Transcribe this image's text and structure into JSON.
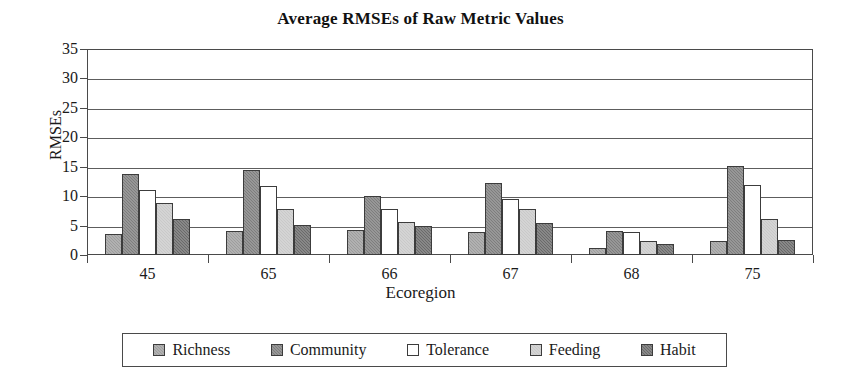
{
  "chart_data": {
    "type": "bar",
    "title": "Average RMSEs of Raw Metric Values",
    "xlabel": "Ecoregion",
    "ylabel": "RMSEs",
    "ylim": [
      0,
      35
    ],
    "ytick_step": 5,
    "yticks": [
      0,
      5,
      10,
      15,
      20,
      25,
      30,
      35
    ],
    "grid": true,
    "legend_position": "bottom",
    "categories": [
      "45",
      "65",
      "66",
      "67",
      "68",
      "75"
    ],
    "series": [
      {
        "name": "Richness",
        "color": "#9d9d9d",
        "values": [
          3.5,
          4.0,
          4.2,
          3.9,
          1.2,
          2.4
        ]
      },
      {
        "name": "Community",
        "color": "#7d7d7d",
        "values": [
          13.7,
          14.4,
          10.0,
          12.2,
          4.0,
          15.2
        ]
      },
      {
        "name": "Tolerance",
        "color": "#ffffff",
        "values": [
          11.0,
          11.7,
          7.9,
          9.5,
          3.9,
          11.9
        ]
      },
      {
        "name": "Feeding",
        "color": "#c9c9c9",
        "values": [
          8.8,
          7.9,
          5.6,
          7.8,
          2.4,
          6.2
        ]
      },
      {
        "name": "Habit",
        "color": "#6a6a6a",
        "values": [
          6.1,
          5.1,
          4.9,
          5.5,
          1.8,
          2.6
        ]
      }
    ]
  }
}
